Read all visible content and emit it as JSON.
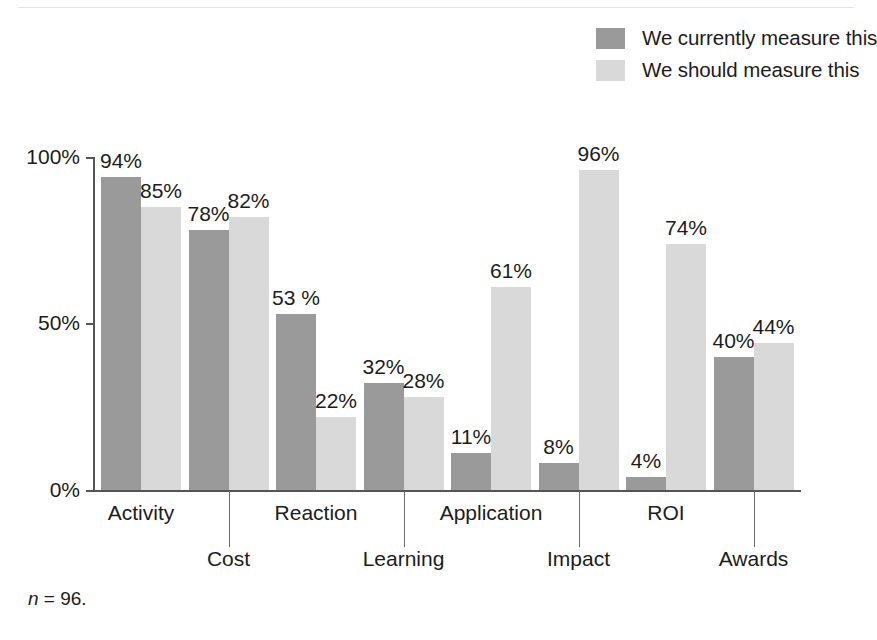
{
  "chart_data": {
    "type": "bar",
    "title": "",
    "subtitle": "",
    "xlabel": "",
    "ylabel": "",
    "ylim": [
      0,
      100
    ],
    "ytick_labels": [
      "0%",
      "50%",
      "100%"
    ],
    "ytick_values": [
      0,
      50,
      100
    ],
    "grid": false,
    "legend_position": "top-right",
    "categories": [
      "Activity",
      "Cost",
      "Reaction",
      "Learning",
      "Application",
      "Impact",
      "ROI",
      "Awards"
    ],
    "series": [
      {
        "name": "We currently measure this",
        "color": "#9a9a9a",
        "values": [
          94,
          78,
          53,
          32,
          11,
          8,
          4,
          40
        ],
        "value_labels": [
          "94%",
          "78%",
          "53 %",
          "32%",
          "11%",
          "8%",
          "4%",
          "40%"
        ]
      },
      {
        "name": "We should measure this",
        "color": "#d9d9d9",
        "values": [
          85,
          82,
          22,
          28,
          61,
          96,
          74,
          44
        ],
        "value_labels": [
          "85%",
          "82%",
          "22%",
          "28%",
          "61%",
          "96%",
          "74%",
          "44%"
        ]
      }
    ],
    "annotations": [
      "n = 96."
    ]
  },
  "legend": {
    "items": [
      {
        "label": "We currently measure this",
        "color": "#9a9a9a"
      },
      {
        "label": "We should measure this",
        "color": "#d9d9d9"
      }
    ]
  },
  "axis": {
    "y_ticks": [
      {
        "label": "100%",
        "value": 100
      },
      {
        "label": "50%",
        "value": 50
      },
      {
        "label": "0%",
        "value": 0
      }
    ]
  },
  "footnote": {
    "symbol": "n",
    "rest": " = 96."
  }
}
